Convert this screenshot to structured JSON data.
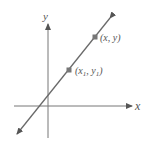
{
  "diagram": {
    "axes": {
      "x_label": "x",
      "y_label": "y",
      "color": "#666666"
    },
    "line": {
      "color": "#6a6a6a",
      "description": "straight line with positive slope, arrows at both ends"
    },
    "points": [
      {
        "label": "(x, y)",
        "color": "#777777"
      },
      {
        "label_main": "(x",
        "sub1": "1",
        "mid": ", y",
        "sub2": "1",
        "end": ")",
        "color": "#777777"
      }
    ]
  }
}
